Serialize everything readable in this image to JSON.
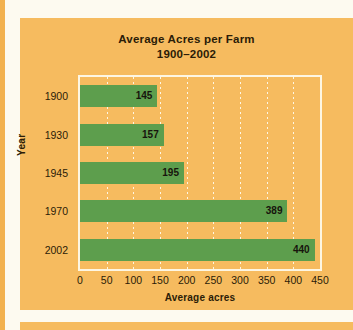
{
  "colors": {
    "panel_background": "#f6bb5f",
    "page_background": "#fdfaf0",
    "bar": "#5d9e4d",
    "gridline": "#fdf6e3",
    "plot_border": "#fdf6e3",
    "text": "#2b1c07"
  },
  "chart_data": {
    "type": "bar",
    "orientation": "horizontal",
    "title": "Average Acres per Farm",
    "subtitle": "1900–2002",
    "categories": [
      "1900",
      "1930",
      "1945",
      "1970",
      "2002"
    ],
    "values": [
      145,
      157,
      195,
      389,
      440
    ],
    "value_labels": [
      "145",
      "157",
      "195",
      "389",
      "440"
    ],
    "xlabel": "Average acres",
    "ylabel": "Year",
    "xlim": [
      0,
      450
    ],
    "xticks": [
      0,
      50,
      100,
      150,
      200,
      250,
      300,
      350,
      400,
      450
    ],
    "xtick_labels": [
      "0",
      "50",
      "100",
      "150",
      "200",
      "250",
      "300",
      "350",
      "400",
      "450"
    ],
    "grid": "vertical-dotted",
    "legend": "none",
    "series": [
      {
        "name": "Average acres per farm",
        "values": [
          145,
          157,
          195,
          389,
          440
        ]
      }
    ]
  }
}
